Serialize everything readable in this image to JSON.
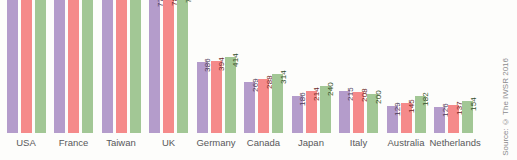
{
  "source_note": "Source: © The IWSR 2016",
  "legend_colors": {
    "series_1": "#b49ccb",
    "series_2": "#f58a8a",
    "series_3": "#a2c795"
  },
  "chart_data": {
    "type": "bar",
    "title": "",
    "subtitle": "",
    "xlabel": "",
    "ylabel": "",
    "grid": false,
    "legend_position": "none",
    "ylim": [
      0,
      900
    ],
    "note": "Top of plot is cropped; USA, France and Taiwan bars extend beyond the visible top edge so their value labels are clipped.",
    "categories": [
      "USA",
      "France",
      "Taiwan",
      "UK",
      "Germany",
      "Canada",
      "Japan",
      "Italy",
      "Australia",
      "Netherlands"
    ],
    "series": [
      {
        "name": "series_1",
        "color": "#b49ccb",
        "values": [
          null,
          null,
          null,
          774,
          386,
          269,
          186,
          215,
          129,
          126
        ],
        "labels": [
          "",
          "",
          "",
          "774",
          "386",
          "269",
          "186",
          "215",
          "129",
          "126"
        ]
      },
      {
        "name": "series_2",
        "color": "#f58a8a",
        "values": [
          null,
          null,
          null,
          780,
          394,
          288,
          214,
          208,
          145,
          137
        ],
        "labels": [
          "",
          "",
          "",
          "780",
          "394",
          "288",
          "214",
          "208",
          "145",
          "137"
        ]
      },
      {
        "name": "series_3",
        "color": "#a2c795",
        "values": [
          null,
          null,
          null,
          795,
          414,
          314,
          240,
          200,
          182,
          154
        ],
        "labels": [
          "",
          "",
          "",
          "795",
          "414",
          "314",
          "240",
          "200",
          "182",
          "154"
        ]
      }
    ],
    "bar_pixel_heights": {
      "USA": [
        165,
        165,
        168
      ],
      "France": [
        152,
        150,
        148
      ],
      "Taiwan": [
        143,
        141,
        140
      ],
      "UK": [
        136,
        137,
        140
      ],
      "Germany": [
        71,
        72,
        76
      ],
      "Canada": [
        51,
        54,
        59
      ],
      "Japan": [
        37,
        42,
        47
      ],
      "Italy": [
        42,
        41,
        39
      ],
      "Australia": [
        27,
        30,
        37
      ],
      "Netherlands": [
        26,
        28,
        32
      ]
    }
  }
}
